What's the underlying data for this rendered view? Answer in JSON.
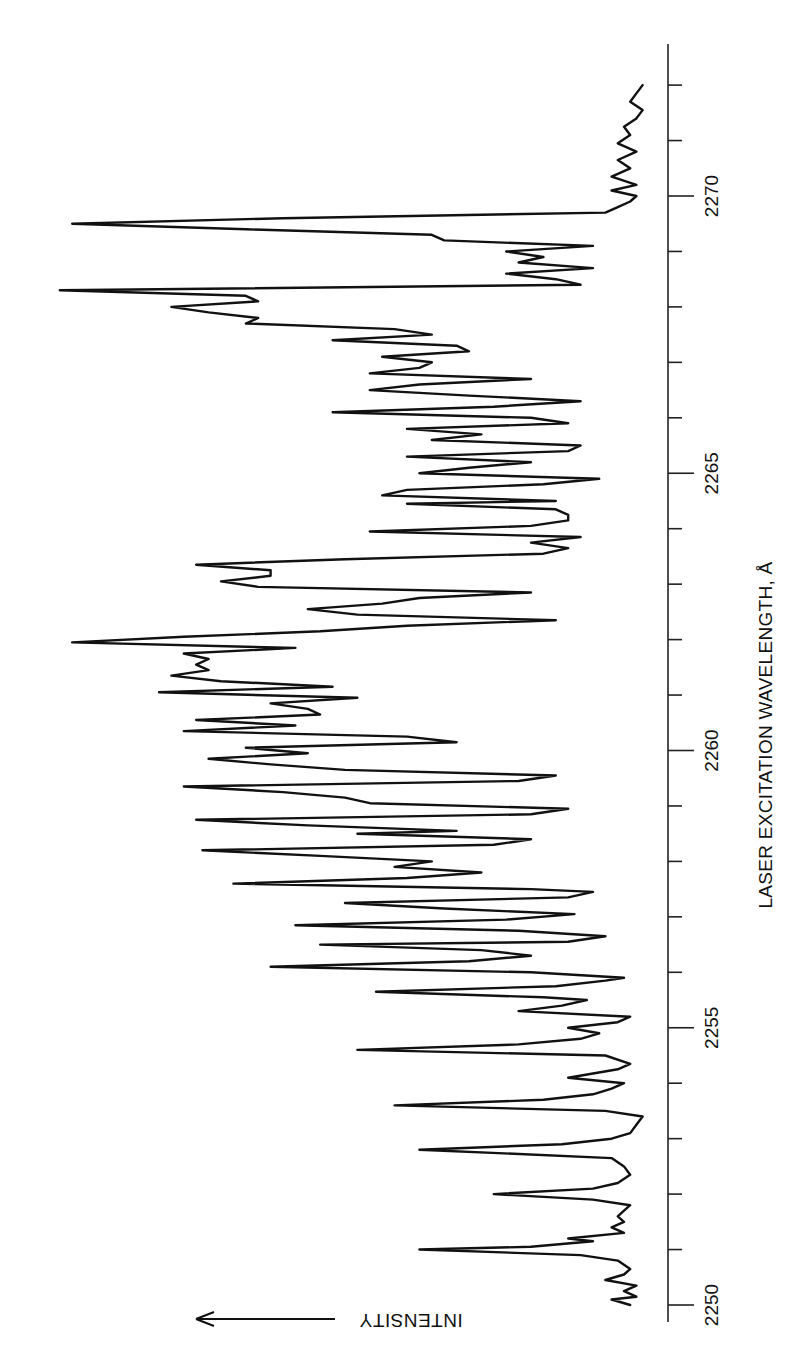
{
  "chart_data": {
    "type": "line",
    "orientation": "rotated-90 (wavelength axis vertical on right, increasing upward; intensity increases to the left)",
    "title": "",
    "xlabel": "LASER EXCITATION WAVELENGTH, Å",
    "ylabel": "INTENSITY",
    "ylabel_arrow": "arrow pointing in direction of increasing intensity",
    "xlim": [
      2250,
      2272
    ],
    "x_ticks_major": [
      2250,
      2255,
      2260,
      2265,
      2270
    ],
    "x_tick_labels": [
      "2250",
      "2255",
      "2260",
      "2265",
      "2270"
    ],
    "x_ticks_minor_step": 1,
    "ylim": [
      0,
      100
    ],
    "y_units": "arbitrary (relative intensity, estimated)",
    "grid": false,
    "legend": null,
    "series": [
      {
        "name": "excitation spectrum",
        "points": [
          [
            2250.0,
            4
          ],
          [
            2250.1,
            7
          ],
          [
            2250.15,
            3
          ],
          [
            2250.25,
            5
          ],
          [
            2250.35,
            3
          ],
          [
            2250.45,
            8
          ],
          [
            2250.55,
            5
          ],
          [
            2250.65,
            4
          ],
          [
            2250.8,
            6
          ],
          [
            2250.9,
            12
          ],
          [
            2251.0,
            38
          ],
          [
            2251.05,
            20
          ],
          [
            2251.15,
            10
          ],
          [
            2251.2,
            14
          ],
          [
            2251.3,
            5
          ],
          [
            2251.4,
            7
          ],
          [
            2251.5,
            5
          ],
          [
            2251.6,
            6
          ],
          [
            2251.7,
            5
          ],
          [
            2251.8,
            4
          ],
          [
            2251.9,
            10
          ],
          [
            2252.0,
            26
          ],
          [
            2252.1,
            10
          ],
          [
            2252.2,
            6
          ],
          [
            2252.35,
            4
          ],
          [
            2252.5,
            5
          ],
          [
            2252.65,
            7
          ],
          [
            2252.8,
            38
          ],
          [
            2252.9,
            15
          ],
          [
            2253.0,
            7
          ],
          [
            2253.1,
            4
          ],
          [
            2253.25,
            3
          ],
          [
            2253.4,
            2
          ],
          [
            2253.5,
            8
          ],
          [
            2253.6,
            42
          ],
          [
            2253.7,
            18
          ],
          [
            2253.8,
            10
          ],
          [
            2253.9,
            7
          ],
          [
            2254.0,
            5
          ],
          [
            2254.1,
            14
          ],
          [
            2254.25,
            6
          ],
          [
            2254.35,
            4
          ],
          [
            2254.5,
            8
          ],
          [
            2254.6,
            48
          ],
          [
            2254.7,
            22
          ],
          [
            2254.8,
            12
          ],
          [
            2254.9,
            9
          ],
          [
            2255.0,
            14
          ],
          [
            2255.1,
            6
          ],
          [
            2255.2,
            4
          ],
          [
            2255.3,
            22
          ],
          [
            2255.4,
            15
          ],
          [
            2255.5,
            11
          ],
          [
            2255.55,
            18
          ],
          [
            2255.65,
            45
          ],
          [
            2255.75,
            16
          ],
          [
            2255.85,
            8
          ],
          [
            2255.9,
            5
          ],
          [
            2256.0,
            20
          ],
          [
            2256.1,
            62
          ],
          [
            2256.2,
            30
          ],
          [
            2256.3,
            20
          ],
          [
            2256.4,
            28
          ],
          [
            2256.5,
            54
          ],
          [
            2256.55,
            14
          ],
          [
            2256.65,
            8
          ],
          [
            2256.75,
            22
          ],
          [
            2256.85,
            58
          ],
          [
            2256.95,
            24
          ],
          [
            2257.05,
            13
          ],
          [
            2257.15,
            34
          ],
          [
            2257.25,
            50
          ],
          [
            2257.35,
            14
          ],
          [
            2257.45,
            10
          ],
          [
            2257.5,
            20
          ],
          [
            2257.6,
            68
          ],
          [
            2257.7,
            40
          ],
          [
            2257.8,
            28
          ],
          [
            2257.9,
            42
          ],
          [
            2258.0,
            36
          ],
          [
            2258.1,
            54
          ],
          [
            2258.2,
            73
          ],
          [
            2258.3,
            26
          ],
          [
            2258.4,
            20
          ],
          [
            2258.5,
            48
          ],
          [
            2258.55,
            32
          ],
          [
            2258.65,
            56
          ],
          [
            2258.75,
            74
          ],
          [
            2258.85,
            20
          ],
          [
            2258.95,
            14
          ],
          [
            2259.05,
            46
          ],
          [
            2259.15,
            50
          ],
          [
            2259.25,
            60
          ],
          [
            2259.35,
            76
          ],
          [
            2259.45,
            22
          ],
          [
            2259.55,
            16
          ],
          [
            2259.65,
            50
          ],
          [
            2259.75,
            62
          ],
          [
            2259.85,
            72
          ],
          [
            2259.95,
            56
          ],
          [
            2260.05,
            66
          ],
          [
            2260.15,
            32
          ],
          [
            2260.25,
            40
          ],
          [
            2260.35,
            76
          ],
          [
            2260.45,
            58
          ],
          [
            2260.55,
            74
          ],
          [
            2260.65,
            54
          ],
          [
            2260.75,
            56
          ],
          [
            2260.85,
            62
          ],
          [
            2260.95,
            48
          ],
          [
            2261.05,
            80
          ],
          [
            2261.15,
            52
          ],
          [
            2261.25,
            70
          ],
          [
            2261.35,
            78
          ],
          [
            2261.45,
            72
          ],
          [
            2261.55,
            74
          ],
          [
            2261.65,
            72
          ],
          [
            2261.75,
            76
          ],
          [
            2261.85,
            58
          ],
          [
            2261.95,
            94
          ],
          [
            2262.05,
            76
          ],
          [
            2262.15,
            54
          ],
          [
            2262.25,
            40
          ],
          [
            2262.35,
            16
          ],
          [
            2262.45,
            48
          ],
          [
            2262.55,
            56
          ],
          [
            2262.65,
            44
          ],
          [
            2262.75,
            38
          ],
          [
            2262.85,
            20
          ],
          [
            2262.95,
            64
          ],
          [
            2263.05,
            70
          ],
          [
            2263.15,
            62
          ],
          [
            2263.25,
            62
          ],
          [
            2263.35,
            74
          ],
          [
            2263.45,
            50
          ],
          [
            2263.55,
            18
          ],
          [
            2263.65,
            14
          ],
          [
            2263.75,
            20
          ],
          [
            2263.85,
            12
          ],
          [
            2263.95,
            46
          ],
          [
            2264.05,
            20
          ],
          [
            2264.15,
            14
          ],
          [
            2264.25,
            14
          ],
          [
            2264.35,
            16
          ],
          [
            2264.45,
            40
          ],
          [
            2264.5,
            16
          ],
          [
            2264.6,
            44
          ],
          [
            2264.7,
            40
          ],
          [
            2264.8,
            18
          ],
          [
            2264.9,
            9
          ],
          [
            2265.0,
            38
          ],
          [
            2265.1,
            30
          ],
          [
            2265.2,
            20
          ],
          [
            2265.3,
            40
          ],
          [
            2265.4,
            14
          ],
          [
            2265.5,
            12
          ],
          [
            2265.6,
            36
          ],
          [
            2265.7,
            28
          ],
          [
            2265.8,
            40
          ],
          [
            2265.9,
            14
          ],
          [
            2266.0,
            20
          ],
          [
            2266.1,
            52
          ],
          [
            2266.2,
            26
          ],
          [
            2266.3,
            12
          ],
          [
            2266.4,
            30
          ],
          [
            2266.5,
            46
          ],
          [
            2266.6,
            38
          ],
          [
            2266.7,
            20
          ],
          [
            2266.8,
            46
          ],
          [
            2266.9,
            38
          ],
          [
            2267.0,
            36
          ],
          [
            2267.1,
            44
          ],
          [
            2267.2,
            30
          ],
          [
            2267.3,
            32
          ],
          [
            2267.4,
            52
          ],
          [
            2267.5,
            36
          ],
          [
            2267.6,
            42
          ],
          [
            2267.7,
            66
          ],
          [
            2267.8,
            64
          ],
          [
            2267.9,
            72
          ],
          [
            2268.0,
            78
          ],
          [
            2268.1,
            64
          ],
          [
            2268.2,
            66
          ],
          [
            2268.3,
            96
          ],
          [
            2268.4,
            12
          ],
          [
            2268.5,
            16
          ],
          [
            2268.6,
            24
          ],
          [
            2268.7,
            10
          ],
          [
            2268.8,
            22
          ],
          [
            2268.9,
            18
          ],
          [
            2269.0,
            24
          ],
          [
            2269.1,
            10
          ],
          [
            2269.2,
            34
          ],
          [
            2269.3,
            36
          ],
          [
            2269.4,
            66
          ],
          [
            2269.5,
            94
          ],
          [
            2269.6,
            60
          ],
          [
            2269.7,
            8
          ],
          [
            2269.8,
            6
          ],
          [
            2269.9,
            4
          ],
          [
            2270.0,
            3
          ],
          [
            2270.1,
            7
          ],
          [
            2270.2,
            3
          ],
          [
            2270.35,
            7
          ],
          [
            2270.5,
            4
          ],
          [
            2270.65,
            6
          ],
          [
            2270.8,
            3
          ],
          [
            2270.95,
            6
          ],
          [
            2271.1,
            4
          ],
          [
            2271.25,
            5
          ],
          [
            2271.4,
            3
          ],
          [
            2271.55,
            2
          ],
          [
            2271.7,
            4
          ],
          [
            2271.85,
            3
          ],
          [
            2272.0,
            2
          ]
        ]
      }
    ]
  },
  "axis": {
    "tick_labels": [
      "2250",
      "2255",
      "2260",
      "2265",
      "2270"
    ],
    "title": "LASER EXCITATION WAVELENGTH, Å",
    "intensity_label": "INTENSITY"
  },
  "colors": {
    "trace": "#111111",
    "axis": "#222222",
    "background": "#ffffff"
  }
}
